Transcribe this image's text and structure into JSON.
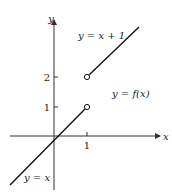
{
  "figure": {
    "axes": {
      "x_label": "x",
      "y_label": "y",
      "x_ticks": [
        {
          "value": 1,
          "label": "1"
        }
      ],
      "y_ticks": [
        {
          "value": 1,
          "label": "1"
        },
        {
          "value": 2,
          "label": "2"
        }
      ]
    },
    "annotations": {
      "upper_line": "y = x + 1",
      "lower_line": "y = x",
      "function": "y = f(x)"
    },
    "segments": [
      {
        "name": "y = x",
        "from": [
          -1.3,
          -1.75
        ],
        "to": [
          1,
          1
        ],
        "end_open": true
      },
      {
        "name": "y = x + 1",
        "from": [
          1,
          2
        ],
        "to": [
          2.6,
          3.7
        ],
        "start_open": true
      }
    ],
    "colors": {
      "line": "#111111",
      "axis": "#333333",
      "background": "#ffffff"
    }
  }
}
